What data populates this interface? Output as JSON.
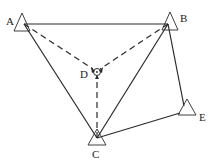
{
  "diagram": {
    "type": "survey-control-network",
    "points": [
      {
        "id": "A",
        "label": "A",
        "symbol": "triangle"
      },
      {
        "id": "B",
        "label": "B",
        "symbol": "triangle"
      },
      {
        "id": "C",
        "label": "C",
        "symbol": "triangle"
      },
      {
        "id": "D",
        "label": "D",
        "symbol": "center-point"
      },
      {
        "id": "E",
        "label": "E",
        "symbol": "triangle"
      }
    ],
    "solid_edges": [
      [
        "A",
        "B"
      ],
      [
        "A",
        "C"
      ],
      [
        "B",
        "C"
      ],
      [
        "B",
        "E"
      ],
      [
        "C",
        "E"
      ]
    ],
    "dashed_edges": [
      [
        "A",
        "D"
      ],
      [
        "B",
        "D"
      ],
      [
        "C",
        "D"
      ]
    ]
  },
  "labels": {
    "A": "A",
    "B": "B",
    "C": "C",
    "D": "D",
    "E": "E"
  },
  "colors": {
    "line": "#2a2a2a",
    "background": "#ffffff"
  }
}
